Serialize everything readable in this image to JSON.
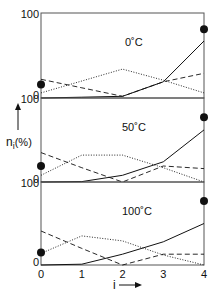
{
  "chart_data": {
    "type": "line",
    "title": "",
    "xlabel": "i",
    "ylabel": "n_i (%)",
    "x": [
      0,
      1,
      2,
      3,
      4
    ],
    "x_tick_labels": [
      "0",
      "1",
      "2",
      "3",
      "4"
    ],
    "ylim": [
      0,
      100
    ],
    "y_tick_labels": [
      "0",
      "100"
    ],
    "grid": false,
    "legend": "none",
    "panels": [
      {
        "label": "0˚C",
        "series": [
          {
            "name": "solid",
            "style": "solid",
            "values": [
              0,
              1,
              2,
              19,
              67
            ]
          },
          {
            "name": "dashed",
            "style": "dashed",
            "values": [
              22,
              12,
              2,
              19,
              29
            ]
          },
          {
            "name": "dotted",
            "style": "dotted",
            "values": [
              6,
              20,
              34,
              21,
              6
            ]
          },
          {
            "name": "markers",
            "style": "dot",
            "points": [
              [
                0,
                16
              ],
              [
                4,
                81
              ]
            ]
          }
        ]
      },
      {
        "label": "50˚C",
        "series": [
          {
            "name": "solid",
            "style": "solid",
            "values": [
              0,
              0.5,
              8,
              24,
              62
            ]
          },
          {
            "name": "dashed",
            "style": "dashed",
            "values": [
              35,
              17,
              0,
              19,
              16
            ]
          },
          {
            "name": "dotted",
            "style": "dotted",
            "values": [
              8,
              32,
              32,
              17,
              0
            ]
          },
          {
            "name": "markers",
            "style": "dot",
            "points": [
              [
                0,
                19
              ],
              [
                4,
                77
              ]
            ]
          }
        ]
      },
      {
        "label": "100˚C",
        "series": [
          {
            "name": "solid",
            "style": "solid",
            "values": [
              0,
              1,
              13,
              28,
              50
            ]
          },
          {
            "name": "dashed",
            "style": "dashed",
            "values": [
              41,
              20,
              0,
              13,
              13
            ]
          },
          {
            "name": "dotted",
            "style": "dotted",
            "values": [
              14,
              35,
              29,
              12,
              0
            ]
          },
          {
            "name": "markers",
            "style": "dot",
            "points": [
              [
                0,
                15
              ],
              [
                4,
                77
              ]
            ]
          }
        ]
      }
    ]
  },
  "axis": {
    "y_label_n": "n",
    "y_label_sub": "i",
    "y_label_unit": "(%)",
    "x_label": "i"
  },
  "colors": {
    "ink": "#111111",
    "frame": "#555555",
    "background": "#ffffff"
  }
}
